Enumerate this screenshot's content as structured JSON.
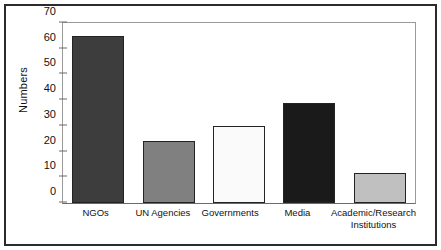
{
  "chart_data": {
    "type": "bar",
    "title": "",
    "xlabel": "",
    "ylabel": "Numbers",
    "ylim": [
      0,
      70
    ],
    "yticks": [
      0,
      10,
      20,
      30,
      40,
      50,
      60,
      70
    ],
    "ytick_labels": [
      "0",
      "10",
      "20",
      "30",
      "40",
      "50",
      "60",
      "70"
    ],
    "grid": false,
    "legend": "none",
    "categories": [
      "NGOs",
      "UN Agencies",
      "Governments",
      "Media",
      "Academic/Research Institutions"
    ],
    "category_lines": [
      [
        "NGOs"
      ],
      [
        "UN Agencies"
      ],
      [
        "Governments"
      ],
      [
        "Media"
      ],
      [
        "Academic/Research",
        "Institutions"
      ]
    ],
    "values": [
      65,
      24,
      30,
      39,
      11.5
    ],
    "bar_colors": [
      "#3d3d3d",
      "#808080",
      "#fafafa",
      "#1a1a1a",
      "#c0c0c0"
    ],
    "bar_edge_color": "#232323"
  },
  "figure": {
    "frame_color": "#2b2b2b",
    "axis_color": "#6a6a6a",
    "plot_border_color": "#9a9a9a",
    "background": "#ffffff"
  }
}
